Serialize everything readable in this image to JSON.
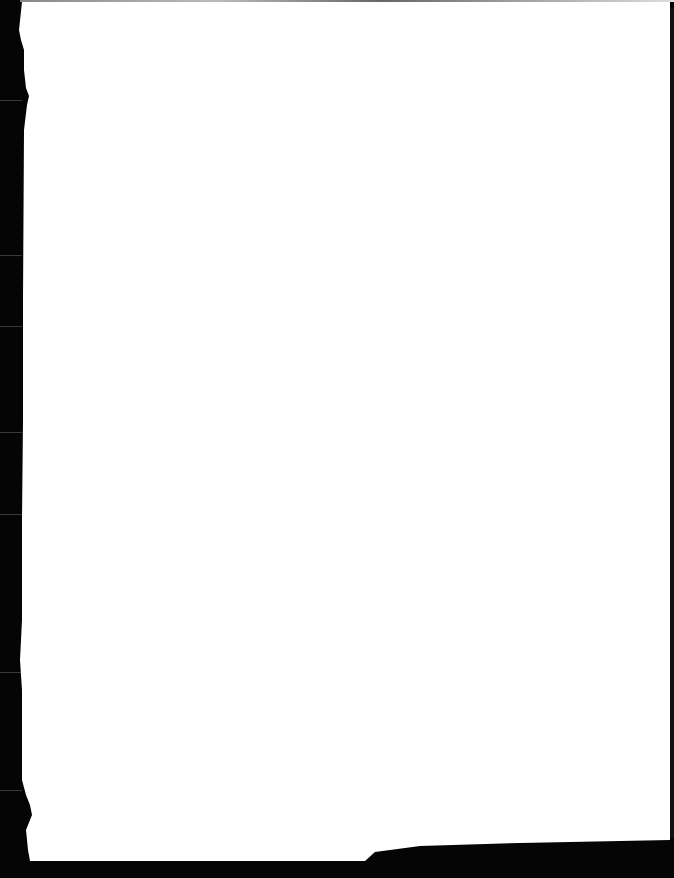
{
  "document": {
    "type": "scanned-page",
    "content": "",
    "colors": {
      "paper": "#ffffff",
      "scanner_background": "#000000"
    }
  }
}
